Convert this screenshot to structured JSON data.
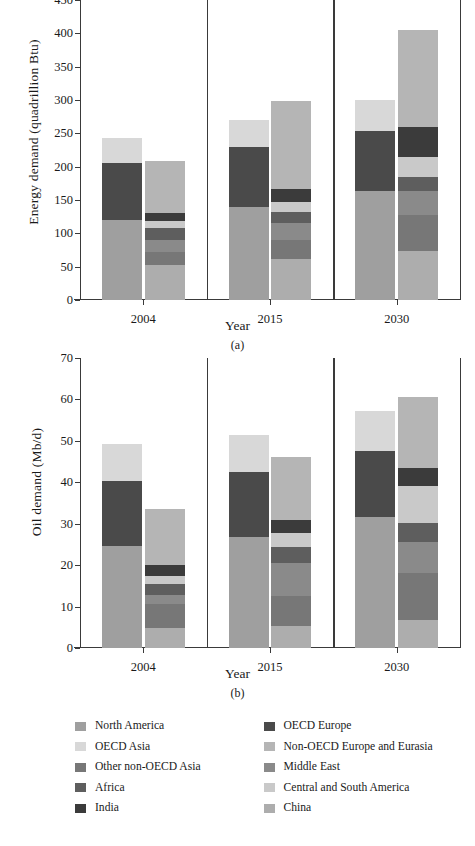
{
  "figure": {
    "panel_a_letter": "(a)",
    "panel_b_letter": "(b)"
  },
  "series_colors": {
    "North America": "#9f9f9f",
    "OECD Europe": "#4a4a4a",
    "OECD Asia": "#d8d8d8",
    "Non-OECD Europe and Eurasia": "#b5b5b5",
    "Other non-OECD Asia": "#777777",
    "Middle East": "#8a8a8a",
    "Africa": "#5e5e5e",
    "Central and South America": "#c9c9c9",
    "India": "#3b3b3b",
    "China": "#adadad"
  },
  "legend": {
    "left_column": [
      {
        "label": "North America",
        "color_key": "North America"
      },
      {
        "label": "OECD Asia",
        "color_key": "OECD Asia"
      },
      {
        "label": "Other non-OECD Asia",
        "color_key": "Other non-OECD Asia"
      },
      {
        "label": "Africa",
        "color_key": "Africa"
      },
      {
        "label": "India",
        "color_key": "India"
      }
    ],
    "right_column": [
      {
        "label": "OECD Europe",
        "color_key": "OECD Europe"
      },
      {
        "label": "Non-OECD Europe and Eurasia",
        "color_key": "Non-OECD Europe and Eurasia"
      },
      {
        "label": "Middle East",
        "color_key": "Middle East"
      },
      {
        "label": "Central and South America",
        "color_key": "Central and South America"
      },
      {
        "label": "China",
        "color_key": "China"
      }
    ]
  },
  "chart_data": [
    {
      "id": "a",
      "type": "bar",
      "stacked": true,
      "title": "",
      "xlabel": "Year",
      "ylabel": "Energy demand (quadrillion Btu)",
      "ylim": [
        0,
        450
      ],
      "yticks": [
        0,
        50,
        100,
        150,
        200,
        250,
        300,
        350,
        400,
        450
      ],
      "grid": false,
      "legend_position": "below-figure",
      "categories": [
        "2004",
        "2015",
        "2030"
      ],
      "bars": [
        {
          "group": "2004",
          "kind": "OECD",
          "total": 243,
          "segments": [
            {
              "name": "North America",
              "value": 120
            },
            {
              "name": "OECD Europe",
              "value": 85
            },
            {
              "name": "OECD Asia",
              "value": 38
            }
          ]
        },
        {
          "group": "2004",
          "kind": "non-OECD",
          "total": 209,
          "segments": [
            {
              "name": "China",
              "value": 52
            },
            {
              "name": "Other non-OECD Asia",
              "value": 20
            },
            {
              "name": "Middle East",
              "value": 18
            },
            {
              "name": "Africa",
              "value": 18
            },
            {
              "name": "Central and South America",
              "value": 11
            },
            {
              "name": "India",
              "value": 12
            },
            {
              "name": "Non-OECD Europe and Eurasia",
              "value": 78
            }
          ]
        },
        {
          "group": "2015",
          "kind": "OECD",
          "total": 270,
          "segments": [
            {
              "name": "North America",
              "value": 139
            },
            {
              "name": "OECD Europe",
              "value": 90
            },
            {
              "name": "OECD Asia",
              "value": 41
            }
          ]
        },
        {
          "group": "2015",
          "kind": "non-OECD",
          "total": 298,
          "segments": [
            {
              "name": "China",
              "value": 61
            },
            {
              "name": "Other non-OECD Asia",
              "value": 29
            },
            {
              "name": "Middle East",
              "value": 25
            },
            {
              "name": "Africa",
              "value": 17
            },
            {
              "name": "Central and South America",
              "value": 15
            },
            {
              "name": "India",
              "value": 20
            },
            {
              "name": "Non-OECD Europe and Eurasia",
              "value": 131
            }
          ]
        },
        {
          "group": "2030",
          "kind": "OECD",
          "total": 300,
          "segments": [
            {
              "name": "North America",
              "value": 163
            },
            {
              "name": "OECD Europe",
              "value": 91
            },
            {
              "name": "OECD Asia",
              "value": 46
            }
          ]
        },
        {
          "group": "2030",
          "kind": "non-OECD",
          "total": 405,
          "segments": [
            {
              "name": "China",
              "value": 73
            },
            {
              "name": "Other non-OECD Asia",
              "value": 55
            },
            {
              "name": "Middle East",
              "value": 35
            },
            {
              "name": "Africa",
              "value": 22
            },
            {
              "name": "Central and South America",
              "value": 30
            },
            {
              "name": "India",
              "value": 45
            },
            {
              "name": "Non-OECD Europe and Eurasia",
              "value": 145
            }
          ]
        }
      ]
    },
    {
      "id": "b",
      "type": "bar",
      "stacked": true,
      "title": "",
      "xlabel": "Year",
      "ylabel": "Oil demand (Mb/d)",
      "ylim": [
        0,
        70
      ],
      "yticks": [
        0,
        10,
        20,
        30,
        40,
        50,
        60,
        70
      ],
      "grid": false,
      "legend_position": "below-figure",
      "categories": [
        "2004",
        "2015",
        "2030"
      ],
      "bars": [
        {
          "group": "2004",
          "kind": "OECD",
          "total": 49.2,
          "segments": [
            {
              "name": "North America",
              "value": 24.7
            },
            {
              "name": "OECD Europe",
              "value": 15.7
            },
            {
              "name": "OECD Asia",
              "value": 8.8
            }
          ]
        },
        {
          "group": "2004",
          "kind": "non-OECD",
          "total": 33.6,
          "segments": [
            {
              "name": "China",
              "value": 4.9
            },
            {
              "name": "Other non-OECD Asia",
              "value": 5.7
            },
            {
              "name": "Middle East",
              "value": 2.3
            },
            {
              "name": "Africa",
              "value": 2.6
            },
            {
              "name": "Central and South America",
              "value": 2.0
            },
            {
              "name": "India",
              "value": 2.5
            },
            {
              "name": "Non-OECD Europe and Eurasia",
              "value": 13.6
            }
          ]
        },
        {
          "group": "2015",
          "kind": "OECD",
          "total": 51.5,
          "segments": [
            {
              "name": "North America",
              "value": 26.8
            },
            {
              "name": "OECD Europe",
              "value": 15.8
            },
            {
              "name": "OECD Asia",
              "value": 8.9
            }
          ]
        },
        {
          "group": "2015",
          "kind": "non-OECD",
          "total": 46.0,
          "segments": [
            {
              "name": "China",
              "value": 5.3
            },
            {
              "name": "Other non-OECD Asia",
              "value": 7.3
            },
            {
              "name": "Middle East",
              "value": 8.0
            },
            {
              "name": "Africa",
              "value": 3.9
            },
            {
              "name": "Central and South America",
              "value": 3.3
            },
            {
              "name": "India",
              "value": 3.2
            },
            {
              "name": "Non-OECD Europe and Eurasia",
              "value": 15.0
            }
          ]
        },
        {
          "group": "2030",
          "kind": "OECD",
          "total": 57.3,
          "segments": [
            {
              "name": "North America",
              "value": 31.6
            },
            {
              "name": "OECD Europe",
              "value": 15.9
            },
            {
              "name": "OECD Asia",
              "value": 9.8
            }
          ]
        },
        {
          "group": "2030",
          "kind": "non-OECD",
          "total": 60.6,
          "segments": [
            {
              "name": "China",
              "value": 6.7
            },
            {
              "name": "Other non-OECD Asia",
              "value": 11.3
            },
            {
              "name": "Middle East",
              "value": 7.5
            },
            {
              "name": "Africa",
              "value": 4.6
            },
            {
              "name": "Central and South America",
              "value": 9.1
            },
            {
              "name": "India",
              "value": 4.3
            },
            {
              "name": "Non-OECD Europe and Eurasia",
              "value": 17.1
            }
          ]
        }
      ]
    }
  ]
}
